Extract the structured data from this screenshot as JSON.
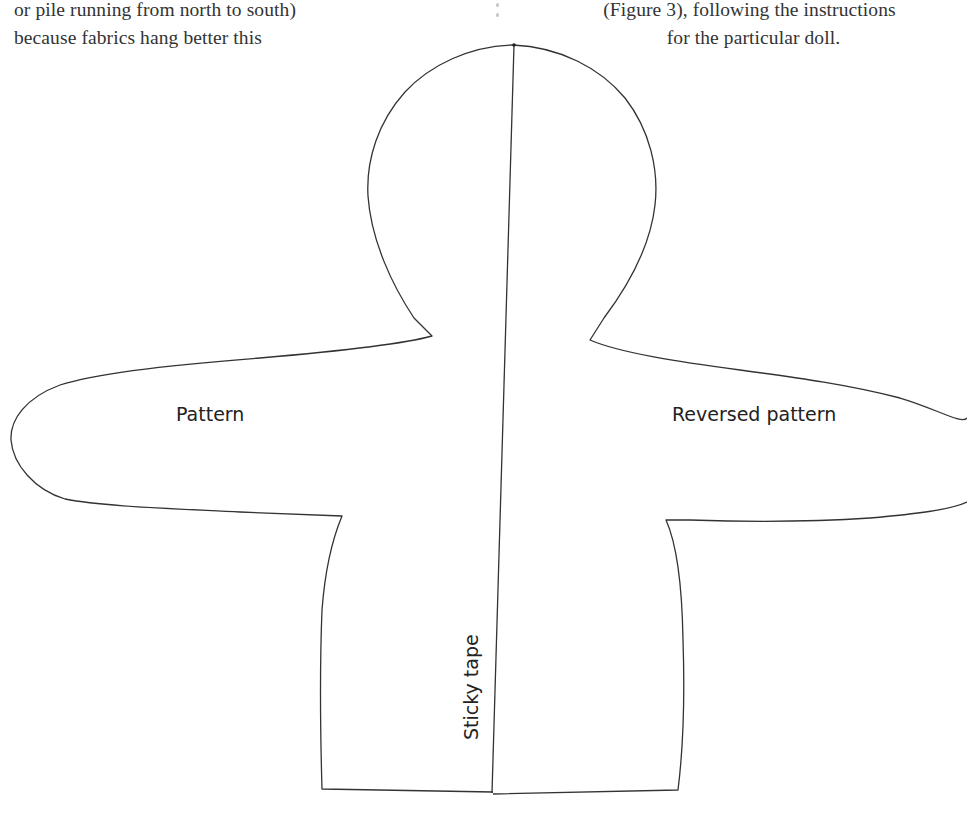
{
  "text": {
    "left_column": [
      "or pile running from north to south)",
      "because fabrics hang better this"
    ],
    "right_column": [
      "(Figure 3), following the instructions",
      "for the particular doll."
    ]
  },
  "figure": {
    "labels": {
      "pattern": "Pattern",
      "reversed_pattern": "Reversed pattern",
      "sticky_tape": "Sticky tape"
    },
    "stroke_color": "#333333",
    "background": "#ffffff"
  }
}
